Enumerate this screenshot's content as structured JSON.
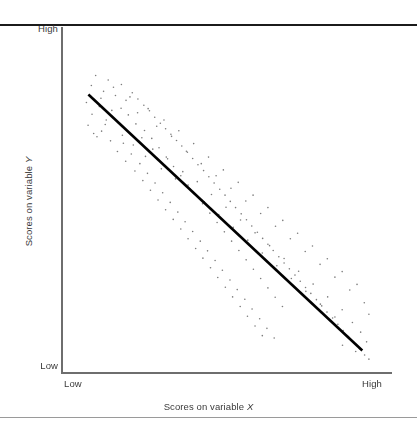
{
  "figure": {
    "width": 417,
    "height": 430,
    "background": "#ffffff",
    "rule_color_top": "#1b1b1b",
    "rule_color_bottom": "#9a9a9a"
  },
  "axes": {
    "y_high_label": "High",
    "y_low_label": "Low",
    "x_low_label": "Low",
    "x_high_label": "High",
    "x_title_prefix": "Scores on variable ",
    "x_title_variable": "X",
    "y_title_prefix": "Scores on variable ",
    "y_title_variable": "Y",
    "axis_color": "#6e6e6e"
  },
  "chart_data": {
    "type": "scatter",
    "title": "",
    "xlabel": "Scores on variable X",
    "ylabel": "Scores on variable Y",
    "xlim": [
      0,
      100
    ],
    "ylim": [
      0,
      100
    ],
    "xtick_labels": [
      "Low",
      "High"
    ],
    "ytick_labels": [
      "Low",
      "High"
    ],
    "grid": false,
    "legend": false,
    "correlation": "strong negative",
    "point_color": "#7d7d7d",
    "point_size_px": 1.6,
    "trendline": {
      "type": "linear",
      "color": "#000000",
      "width_px": 2.6,
      "x_start": 8.0,
      "y_start": 80.5,
      "x_end": 91.0,
      "y_end": 6.5
    },
    "points": [
      [
        8.9,
        83.1
      ],
      [
        7.4,
        78.2
      ],
      [
        10.2,
        86.0
      ],
      [
        12.6,
        81.4
      ],
      [
        9.1,
        74.8
      ],
      [
        14.0,
        84.7
      ],
      [
        11.3,
        77.0
      ],
      [
        16.2,
        80.2
      ],
      [
        13.4,
        73.1
      ],
      [
        18.0,
        83.4
      ],
      [
        7.9,
        71.6
      ],
      [
        15.1,
        75.9
      ],
      [
        19.4,
        78.8
      ],
      [
        12.0,
        69.9
      ],
      [
        21.3,
        81.0
      ],
      [
        17.0,
        72.4
      ],
      [
        23.0,
        79.2
      ],
      [
        10.6,
        68.3
      ],
      [
        20.1,
        74.6
      ],
      [
        24.8,
        77.4
      ],
      [
        14.7,
        67.1
      ],
      [
        22.4,
        72.0
      ],
      [
        26.5,
        75.8
      ],
      [
        18.6,
        66.4
      ],
      [
        28.1,
        73.9
      ],
      [
        16.8,
        64.0
      ],
      [
        25.0,
        70.1
      ],
      [
        29.8,
        72.2
      ],
      [
        21.0,
        63.3
      ],
      [
        31.4,
        70.6
      ],
      [
        19.3,
        61.2
      ],
      [
        27.2,
        67.8
      ],
      [
        33.0,
        69.0
      ],
      [
        23.6,
        60.5
      ],
      [
        34.7,
        67.2
      ],
      [
        22.1,
        58.4
      ],
      [
        29.4,
        65.1
      ],
      [
        36.3,
        65.6
      ],
      [
        25.9,
        57.7
      ],
      [
        38.0,
        63.8
      ],
      [
        24.5,
        55.6
      ],
      [
        31.6,
        62.4
      ],
      [
        39.6,
        62.0
      ],
      [
        28.2,
        54.9
      ],
      [
        41.2,
        60.2
      ],
      [
        26.8,
        52.8
      ],
      [
        33.8,
        59.7
      ],
      [
        42.9,
        58.5
      ],
      [
        30.5,
        52.1
      ],
      [
        44.5,
        56.7
      ],
      [
        29.1,
        50.0
      ],
      [
        36.0,
        57.0
      ],
      [
        46.1,
        54.9
      ],
      [
        32.8,
        49.3
      ],
      [
        47.8,
        53.1
      ],
      [
        31.4,
        47.2
      ],
      [
        38.2,
        54.3
      ],
      [
        49.4,
        51.4
      ],
      [
        35.1,
        46.5
      ],
      [
        51.0,
        49.6
      ],
      [
        33.7,
        44.4
      ],
      [
        40.4,
        51.6
      ],
      [
        52.6,
        47.8
      ],
      [
        37.3,
        43.7
      ],
      [
        54.3,
        46.0
      ],
      [
        36.0,
        41.6
      ],
      [
        42.6,
        48.9
      ],
      [
        55.9,
        44.3
      ],
      [
        39.6,
        40.9
      ],
      [
        57.5,
        42.5
      ],
      [
        38.2,
        38.8
      ],
      [
        44.8,
        46.2
      ],
      [
        59.2,
        40.7
      ],
      [
        41.9,
        38.1
      ],
      [
        60.8,
        38.9
      ],
      [
        40.5,
        36.0
      ],
      [
        47.0,
        43.5
      ],
      [
        62.4,
        37.2
      ],
      [
        44.1,
        35.3
      ],
      [
        64.0,
        35.4
      ],
      [
        42.7,
        33.2
      ],
      [
        49.2,
        40.8
      ],
      [
        65.7,
        33.6
      ],
      [
        46.4,
        32.5
      ],
      [
        67.3,
        31.8
      ],
      [
        45.0,
        30.4
      ],
      [
        51.4,
        38.1
      ],
      [
        68.9,
        30.1
      ],
      [
        48.6,
        29.7
      ],
      [
        70.6,
        28.3
      ],
      [
        47.2,
        27.6
      ],
      [
        53.6,
        35.4
      ],
      [
        72.2,
        26.5
      ],
      [
        50.9,
        26.9
      ],
      [
        73.8,
        24.7
      ],
      [
        49.5,
        24.8
      ],
      [
        55.8,
        32.7
      ],
      [
        75.4,
        23.0
      ],
      [
        53.1,
        24.1
      ],
      [
        77.1,
        21.2
      ],
      [
        51.7,
        22.0
      ],
      [
        58.0,
        30.0
      ],
      [
        78.7,
        19.4
      ],
      [
        55.4,
        21.3
      ],
      [
        80.3,
        17.6
      ],
      [
        54.0,
        19.2
      ],
      [
        60.2,
        27.3
      ],
      [
        82.0,
        15.9
      ],
      [
        57.6,
        18.5
      ],
      [
        83.6,
        14.1
      ],
      [
        56.2,
        16.4
      ],
      [
        62.4,
        24.6
      ],
      [
        85.2,
        12.3
      ],
      [
        59.9,
        15.7
      ],
      [
        86.8,
        10.5
      ],
      [
        58.5,
        13.6
      ],
      [
        64.6,
        21.9
      ],
      [
        88.5,
        8.8
      ],
      [
        62.1,
        12.9
      ],
      [
        90.1,
        7.0
      ],
      [
        60.7,
        10.8
      ],
      [
        66.8,
        19.2
      ],
      [
        91.7,
        5.2
      ],
      [
        64.3,
        10.1
      ],
      [
        93.0,
        4.0
      ],
      [
        11.8,
        79.4
      ],
      [
        15.6,
        82.6
      ],
      [
        9.6,
        69.2
      ],
      [
        17.9,
        76.5
      ],
      [
        13.1,
        71.8
      ],
      [
        20.6,
        79.8
      ],
      [
        22.9,
        75.2
      ],
      [
        18.3,
        68.7
      ],
      [
        26.1,
        76.4
      ],
      [
        24.2,
        68.0
      ],
      [
        28.7,
        71.3
      ],
      [
        21.6,
        65.9
      ],
      [
        30.9,
        73.1
      ],
      [
        27.5,
        64.7
      ],
      [
        33.2,
        68.4
      ],
      [
        25.3,
        62.6
      ],
      [
        35.4,
        70.0
      ],
      [
        32.0,
        61.9
      ],
      [
        37.7,
        64.1
      ],
      [
        30.1,
        59.0
      ],
      [
        39.9,
        66.3
      ],
      [
        36.6,
        58.2
      ],
      [
        42.2,
        60.5
      ],
      [
        34.4,
        56.1
      ],
      [
        44.4,
        62.4
      ],
      [
        41.0,
        55.3
      ],
      [
        46.7,
        57.0
      ],
      [
        38.8,
        53.2
      ],
      [
        48.9,
        58.7
      ],
      [
        45.3,
        51.6
      ],
      [
        51.2,
        53.4
      ],
      [
        43.1,
        49.5
      ],
      [
        53.4,
        55.1
      ],
      [
        49.7,
        47.9
      ],
      [
        55.7,
        49.7
      ],
      [
        47.5,
        45.8
      ],
      [
        57.9,
        51.4
      ],
      [
        54.1,
        44.2
      ],
      [
        60.2,
        46.1
      ],
      [
        51.9,
        42.1
      ],
      [
        62.4,
        47.8
      ],
      [
        58.5,
        40.5
      ],
      [
        64.7,
        42.4
      ],
      [
        56.3,
        38.4
      ],
      [
        66.9,
        44.1
      ],
      [
        62.9,
        36.8
      ],
      [
        69.2,
        38.8
      ],
      [
        60.7,
        34.7
      ],
      [
        71.4,
        40.4
      ],
      [
        67.3,
        33.1
      ],
      [
        73.7,
        35.1
      ],
      [
        65.1,
        31.0
      ],
      [
        75.9,
        36.7
      ],
      [
        71.7,
        29.4
      ],
      [
        78.2,
        31.4
      ],
      [
        69.5,
        27.3
      ],
      [
        80.4,
        33.0
      ],
      [
        76.1,
        25.7
      ],
      [
        82.7,
        27.7
      ],
      [
        73.9,
        23.6
      ],
      [
        84.9,
        29.3
      ],
      [
        80.5,
        22.0
      ],
      [
        87.2,
        24.0
      ],
      [
        78.3,
        19.9
      ],
      [
        89.4,
        25.6
      ],
      [
        84.9,
        18.3
      ],
      [
        91.6,
        20.3
      ],
      [
        82.7,
        16.2
      ],
      [
        93.0,
        17.0
      ],
      [
        88.0,
        14.6
      ],
      [
        86.0,
        11.0
      ],
      [
        90.5,
        11.8
      ],
      [
        92.3,
        9.0
      ],
      [
        85.0,
        8.0
      ],
      [
        89.0,
        6.2
      ]
    ]
  }
}
